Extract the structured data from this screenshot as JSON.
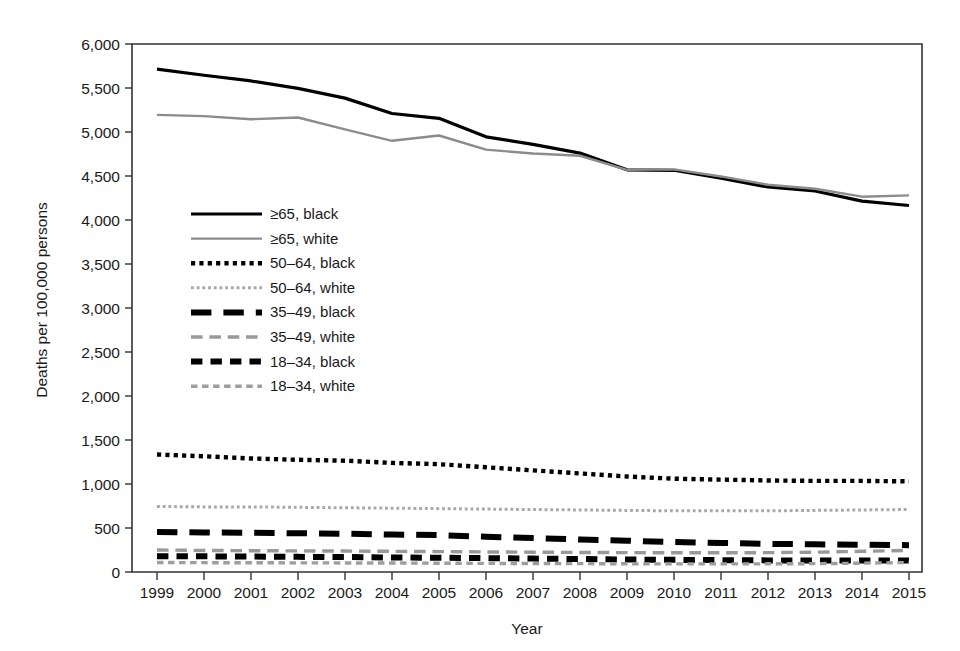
{
  "chart_data": {
    "type": "line",
    "title": "",
    "xlabel": "Year",
    "ylabel": "Deaths per 100,000 persons",
    "xlim": [
      1999,
      2015
    ],
    "ylim": [
      0,
      6000
    ],
    "grid": false,
    "legend_position": "inside-upper-left",
    "x": [
      1999,
      2000,
      2001,
      2002,
      2003,
      2004,
      2005,
      2006,
      2007,
      2008,
      2009,
      2010,
      2011,
      2012,
      2013,
      2014,
      2015
    ],
    "categories": [
      "1999",
      "2000",
      "2001",
      "2002",
      "2003",
      "2004",
      "2005",
      "2006",
      "2007",
      "2008",
      "2009",
      "2010",
      "2011",
      "2012",
      "2013",
      "2014",
      "2015"
    ],
    "ytick_labels": [
      "0",
      "500",
      "1,000",
      "1,500",
      "2,000",
      "2,500",
      "3,000",
      "3,500",
      "4,000",
      "4,500",
      "5,000",
      "5,500",
      "6,000"
    ],
    "ytick_values": [
      0,
      500,
      1000,
      1500,
      2000,
      2500,
      3000,
      3500,
      4000,
      4500,
      5000,
      5500,
      6000
    ],
    "series": [
      {
        "name": "≥65, black",
        "color": "#000000",
        "width": 3.2,
        "dash": "none",
        "values": [
          5715,
          5645,
          5580,
          5495,
          5385,
          5210,
          5155,
          4945,
          4860,
          4760,
          4570,
          4565,
          4475,
          4375,
          4330,
          4215,
          4165
        ]
      },
      {
        "name": "≥65, white",
        "color": "#8c8c8c",
        "width": 2.4,
        "dash": "none",
        "values": [
          5195,
          5180,
          5145,
          5165,
          5030,
          4900,
          4960,
          4800,
          4755,
          4730,
          4570,
          4575,
          4495,
          4400,
          4355,
          4265,
          4280
        ]
      },
      {
        "name": "50–64, black",
        "color": "#000000",
        "width": 4.4,
        "dash": "dotted",
        "values": [
          1335,
          1315,
          1290,
          1275,
          1265,
          1240,
          1225,
          1190,
          1155,
          1120,
          1085,
          1060,
          1050,
          1040,
          1035,
          1035,
          1030
        ]
      },
      {
        "name": "50–64, white",
        "color": "#a8a8a8",
        "width": 3.0,
        "dash": "dotted",
        "values": [
          745,
          740,
          740,
          735,
          730,
          725,
          720,
          715,
          710,
          705,
          700,
          695,
          695,
          695,
          700,
          705,
          710
        ]
      },
      {
        "name": "35–49, black",
        "color": "#000000",
        "width": 6.0,
        "dash": "long-dash",
        "values": [
          455,
          450,
          445,
          440,
          435,
          425,
          420,
          400,
          385,
          370,
          355,
          340,
          330,
          320,
          315,
          310,
          305
        ]
      },
      {
        "name": "35–49, white",
        "color": "#999999",
        "width": 3.4,
        "dash": "long-dash",
        "values": [
          250,
          245,
          242,
          240,
          238,
          235,
          232,
          228,
          225,
          222,
          220,
          218,
          218,
          220,
          225,
          235,
          245
        ]
      },
      {
        "name": "18–34, black",
        "color": "#000000",
        "width": 6.0,
        "dash": "dash",
        "values": [
          180,
          178,
          175,
          172,
          170,
          165,
          162,
          158,
          152,
          148,
          142,
          138,
          135,
          132,
          130,
          130,
          130
        ]
      },
      {
        "name": "18–34, white",
        "color": "#9e9e9e",
        "width": 3.4,
        "dash": "dash",
        "values": [
          108,
          106,
          105,
          104,
          103,
          102,
          100,
          98,
          96,
          95,
          93,
          92,
          92,
          93,
          95,
          100,
          108
        ]
      }
    ]
  },
  "legend": {
    "items": [
      {
        "label": "≥65, black"
      },
      {
        "label": "≥65, white"
      },
      {
        "label": "50–64, black"
      },
      {
        "label": "50–64, white"
      },
      {
        "label": "35–49, black"
      },
      {
        "label": "35–49, white"
      },
      {
        "label": "18–34, black"
      },
      {
        "label": "18–34, white"
      }
    ]
  },
  "colors": {
    "black_series": "#000000",
    "white_series": "#8c8c8c",
    "axis": "#333333",
    "background": "#ffffff"
  }
}
